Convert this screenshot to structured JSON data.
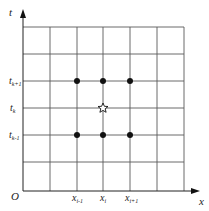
{
  "diagram": {
    "type": "finite-difference grid stencil",
    "axes": {
      "x_label": "x",
      "y_label": "t",
      "origin_label": "O"
    },
    "x_ticks": [
      {
        "base": "x",
        "sub": "i-1"
      },
      {
        "base": "x",
        "sub": "i"
      },
      {
        "base": "x",
        "sub": "i+1"
      }
    ],
    "t_ticks": [
      {
        "base": "t",
        "sub": "k+1"
      },
      {
        "base": "t",
        "sub": "k"
      },
      {
        "base": "t",
        "sub": "k-1"
      }
    ],
    "grid": {
      "columns": 6,
      "rows": 6
    },
    "points": [
      {
        "x": "x_{i-1}",
        "t": "t_{k+1}",
        "marker": "dot"
      },
      {
        "x": "x_i",
        "t": "t_{k+1}",
        "marker": "dot"
      },
      {
        "x": "x_{i+1}",
        "t": "t_{k+1}",
        "marker": "dot"
      },
      {
        "x": "x_i",
        "t": "t_k",
        "marker": "star"
      },
      {
        "x": "x_{i-1}",
        "t": "t_{k-1}",
        "marker": "dot"
      },
      {
        "x": "x_i",
        "t": "t_{k-1}",
        "marker": "dot"
      },
      {
        "x": "x_{i+1}",
        "t": "t_{k-1}",
        "marker": "dot"
      }
    ],
    "colors": {
      "grid": "#555555",
      "axis": "#222222",
      "marker": "#111111"
    }
  }
}
